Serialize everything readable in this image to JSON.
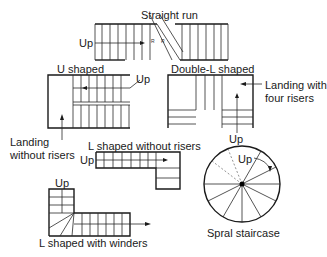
{
  "diagram": {
    "types": {
      "straight_run": {
        "title": "Straight run",
        "up_label": "Up"
      },
      "u_shaped": {
        "title": "U shaped",
        "up_label": "Up",
        "callout_line1": "Landing",
        "callout_line2": "without risers"
      },
      "double_l_shaped": {
        "title": "Double-L shaped",
        "up_label": "Up",
        "callout_line1": "Landing with",
        "callout_line2": "four risers"
      },
      "l_shaped_without_risers": {
        "title": "L shaped without risers",
        "up_label": "Up"
      },
      "l_shaped_with_winders": {
        "title": "L shaped with winders",
        "up_label": "Up"
      },
      "spiral": {
        "title": "Spral staircase",
        "up_label": "Up"
      }
    },
    "colors": {
      "line": "#2a2a2a",
      "background": "#ffffff"
    }
  }
}
